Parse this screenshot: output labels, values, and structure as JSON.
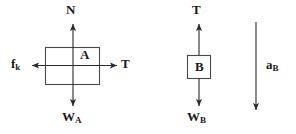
{
  "figure": {
    "type": "free-body-diagram",
    "background_color": "#ffffff",
    "stroke_color": "#3a3a3a",
    "text_color": "#1a1a1a",
    "width": 296,
    "height": 134
  },
  "body_a": {
    "box_label": "A",
    "shape": "rectangle",
    "forces": [
      {
        "id": "normal",
        "label_main": "N",
        "label_sub": "",
        "direction": "up"
      },
      {
        "id": "weight",
        "label_main": "W",
        "label_sub": "A",
        "direction": "down"
      },
      {
        "id": "friction",
        "label_main": "f",
        "label_sub": "k",
        "direction": "left"
      },
      {
        "id": "tension",
        "label_main": "T",
        "label_sub": "",
        "direction": "right"
      }
    ],
    "labels": {
      "normal": "N",
      "weight_main": "W",
      "weight_sub": "A",
      "friction_main": "f",
      "friction_sub": "k",
      "tension": "T"
    }
  },
  "body_b": {
    "box_label": "B",
    "shape": "square",
    "forces": [
      {
        "id": "tension",
        "label_main": "T",
        "label_sub": "",
        "direction": "up"
      },
      {
        "id": "weight",
        "label_main": "W",
        "label_sub": "B",
        "direction": "down"
      }
    ],
    "labels": {
      "tension": "T",
      "weight_main": "W",
      "weight_sub": "B"
    }
  },
  "acceleration": {
    "label_main": "a",
    "label_sub": "B",
    "direction": "down"
  }
}
